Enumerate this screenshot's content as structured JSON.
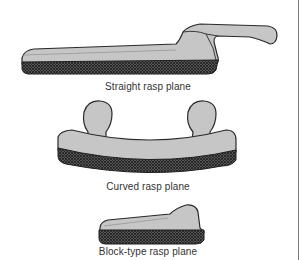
{
  "figure": {
    "items": [
      {
        "id": "straight",
        "caption": "Straight rasp plane"
      },
      {
        "id": "curved",
        "caption": "Curved rasp plane"
      },
      {
        "id": "block",
        "caption": "Block-type rasp plane"
      }
    ],
    "colors": {
      "body": "#c4c4c4",
      "outline": "#2a2a2a",
      "rasp": "#3a3a3a",
      "edge_line": "#7a7a7a"
    }
  }
}
